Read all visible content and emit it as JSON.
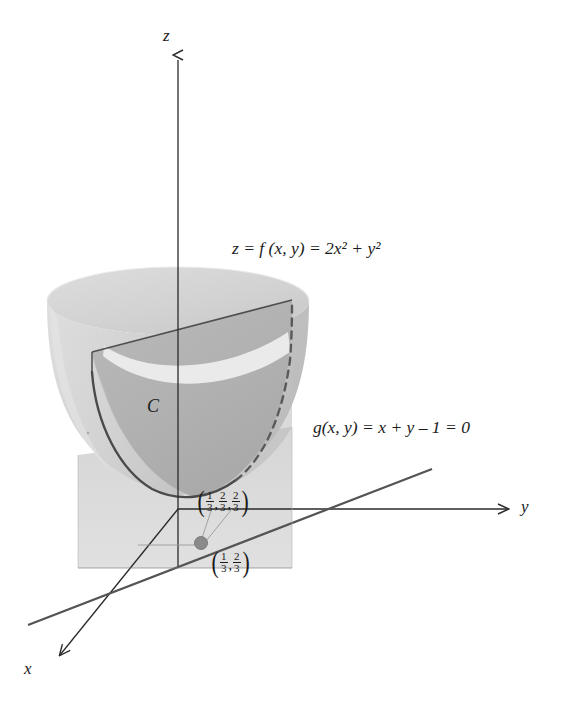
{
  "figure": {
    "type": "math-3d-diagram",
    "topic": "Lagrange multipliers: constrained extremum on a paraboloid",
    "cropped_caption_fragment": "g = 4y, 3.",
    "axes": {
      "z_label": "z",
      "y_label": "y",
      "x_label": "x"
    },
    "surface": {
      "equation_label": "z = f (x, y) = 2x² + y²",
      "name": "paraboloid",
      "fill_light": "#d6d6d6",
      "fill_mid": "#c2c2c2",
      "fill_dark": "#a8a8a8",
      "rim_highlight": "#f2f2f2"
    },
    "constraint": {
      "equation_label": "g(x, y) = x + y – 1 = 0",
      "line_color": "#555555"
    },
    "curve": {
      "label": "C",
      "solid_color": "#4a4a4a",
      "dashed_color": "#5a5a5a"
    },
    "plane": {
      "name": "vertical-constraint-plane",
      "fill": "#cfcfcf"
    },
    "points": [
      {
        "name": "surface-point",
        "label_parts": [
          "1",
          "3",
          "2",
          "3",
          "2",
          "3"
        ],
        "dimensions": 3
      },
      {
        "name": "base-point",
        "label_parts": [
          "1",
          "3",
          "2",
          "3"
        ],
        "dimensions": 2,
        "dot_color": "#8a8a8a"
      }
    ],
    "colors": {
      "ink": "#1b1b1b",
      "axis": "#2a2a2a",
      "background": "#ffffff"
    }
  }
}
